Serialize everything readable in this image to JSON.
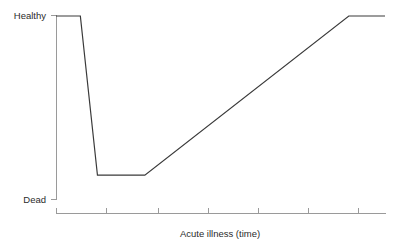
{
  "chart_data": {
    "type": "line",
    "title": "",
    "subtitle": "",
    "xlabel": "Acute illness (time)",
    "ylabel": "",
    "grid": false,
    "legend": null,
    "legend_position": "none",
    "x": [
      0,
      7.4,
      12.6,
      27.0,
      89.0,
      100.0
    ],
    "y": [
      100,
      100,
      13,
      13,
      100,
      100
    ],
    "series": [
      {
        "name": "health-status",
        "color": "#3a3a3a",
        "points": [
          {
            "x": 0,
            "y": 100
          },
          {
            "x": 7.4,
            "y": 100
          },
          {
            "x": 12.6,
            "y": 13
          },
          {
            "x": 27.0,
            "y": 13
          },
          {
            "x": 89.0,
            "y": 100
          },
          {
            "x": 100.0,
            "y": 100
          }
        ]
      }
    ],
    "xlim": [
      0,
      100
    ],
    "ylim": [
      0,
      100
    ],
    "xticks": [
      0,
      15.2,
      31.0,
      46.2,
      61.4,
      76.6,
      91.8
    ],
    "xticklabels": [
      "",
      "",
      "",
      "",
      "",
      "",
      ""
    ],
    "yticks": [
      0,
      100
    ],
    "yticklabels": [
      "Dead",
      "Healthy"
    ],
    "annotations": []
  },
  "labels": {
    "y_top": "Healthy",
    "y_bottom": "Dead",
    "x_axis_title": "Acute illness (time)"
  },
  "colors": {
    "background": "#ffffff",
    "line": "#3a3a3a",
    "axis": "#9a9a9a",
    "text": "#2b2b2b"
  }
}
